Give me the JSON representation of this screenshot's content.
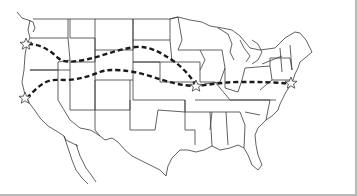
{
  "map": {
    "type": "outline-map",
    "region": "contiguous United States",
    "style": {
      "background": "#ffffff",
      "border_color": "#3a3a3a",
      "route_color": "#1a1a1a",
      "frame_color": "#b9b9b9"
    },
    "routes": [
      {
        "name": "northern-route",
        "style": "dashed",
        "points": [
          [
            28,
            44
          ],
          [
            45,
            47
          ],
          [
            58,
            57
          ],
          [
            70,
            62
          ],
          [
            90,
            58
          ],
          [
            110,
            54
          ],
          [
            135,
            47
          ],
          [
            150,
            48
          ],
          [
            170,
            58
          ],
          [
            185,
            68
          ],
          [
            196,
            86
          ]
        ]
      },
      {
        "name": "southern-route",
        "style": "dashed",
        "points": [
          [
            27,
            98
          ],
          [
            35,
            92
          ],
          [
            45,
            82
          ],
          [
            58,
            80
          ],
          [
            70,
            80
          ],
          [
            90,
            75
          ],
          [
            98,
            72
          ],
          [
            110,
            68
          ],
          [
            150,
            75
          ],
          [
            175,
            83
          ],
          [
            196,
            86
          ],
          [
            215,
            84
          ],
          [
            230,
            82
          ],
          [
            260,
            82
          ],
          [
            285,
            82
          ],
          [
            292,
            85
          ]
        ]
      }
    ],
    "markers": [
      {
        "name": "star-northwest",
        "x": 26,
        "y": 44
      },
      {
        "name": "star-west",
        "x": 25,
        "y": 98
      },
      {
        "name": "star-midwest",
        "x": 196,
        "y": 86
      },
      {
        "name": "star-east",
        "x": 291,
        "y": 83
      }
    ]
  }
}
